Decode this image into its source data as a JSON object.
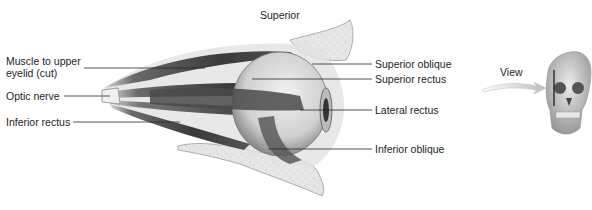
{
  "diagram": {
    "orientation_label": "Superior",
    "left_labels": [
      {
        "id": "muscle-upper-eyelid",
        "line1": "Muscle to upper",
        "line2": "eyelid (cut)"
      },
      {
        "id": "optic-nerve",
        "line1": "Optic nerve"
      },
      {
        "id": "inferior-rectus",
        "line1": "Inferior rectus"
      }
    ],
    "right_labels": [
      {
        "id": "superior-oblique",
        "text": "Superior oblique"
      },
      {
        "id": "superior-rectus",
        "text": "Superior rectus"
      },
      {
        "id": "lateral-rectus",
        "text": "Lateral rectus"
      },
      {
        "id": "inferior-oblique",
        "text": "Inferior oblique"
      }
    ],
    "inset": {
      "view_label": "View",
      "icon": "skull-front-view-icon"
    }
  }
}
